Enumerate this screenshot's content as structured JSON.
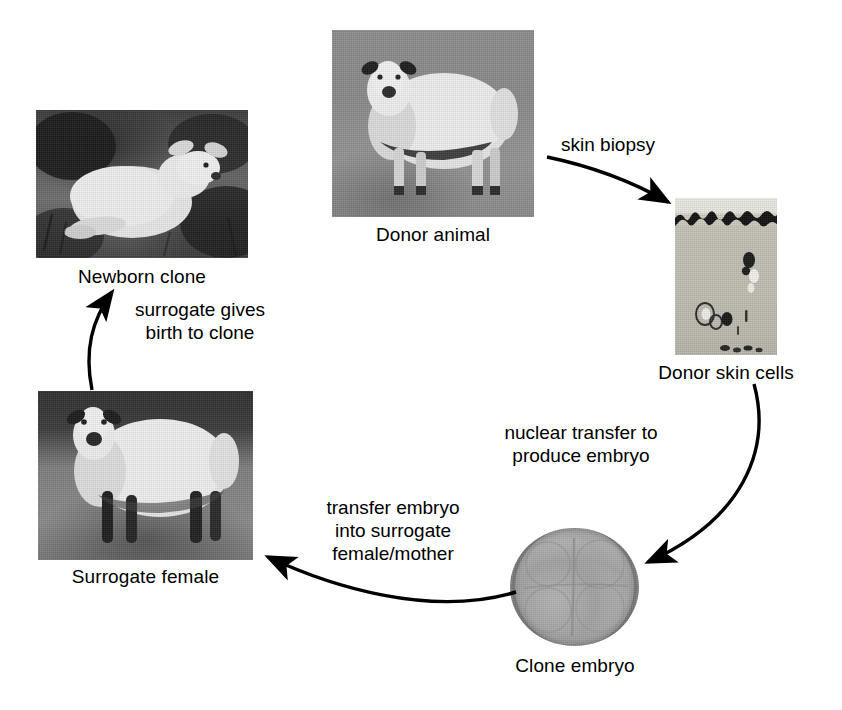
{
  "diagram": {
    "background_color": "#ffffff",
    "text_color": "#000000",
    "nodes": [
      {
        "id": "donor_animal",
        "caption": "Donor animal",
        "image": "photo-sheep-standing-on-grass"
      },
      {
        "id": "donor_skin",
        "caption": "Donor skin cells",
        "image": "photo-skin-histology-section"
      },
      {
        "id": "clone_embryo",
        "caption": "Clone embryo",
        "image": "photo-four-cell-embryo"
      },
      {
        "id": "surrogate",
        "caption": "Surrogate female",
        "image": "photo-sheep-dark-background"
      },
      {
        "id": "newborn_clone",
        "caption": "Newborn clone",
        "image": "photo-lamb-lying-in-grass"
      }
    ],
    "arrows": [
      {
        "id": "biopsy",
        "label": "skin biopsy",
        "from": "donor_animal",
        "to": "donor_skin"
      },
      {
        "id": "nuclear",
        "label": "nuclear transfer to\nproduce embryo",
        "from": "donor_skin",
        "to": "clone_embryo"
      },
      {
        "id": "transfer",
        "label": "transfer embryo\ninto surrogate\nfemale/mother",
        "from": "clone_embryo",
        "to": "surrogate"
      },
      {
        "id": "birth",
        "label": "surrogate gives\nbirth to clone",
        "from": "surrogate",
        "to": "newborn_clone"
      }
    ]
  }
}
